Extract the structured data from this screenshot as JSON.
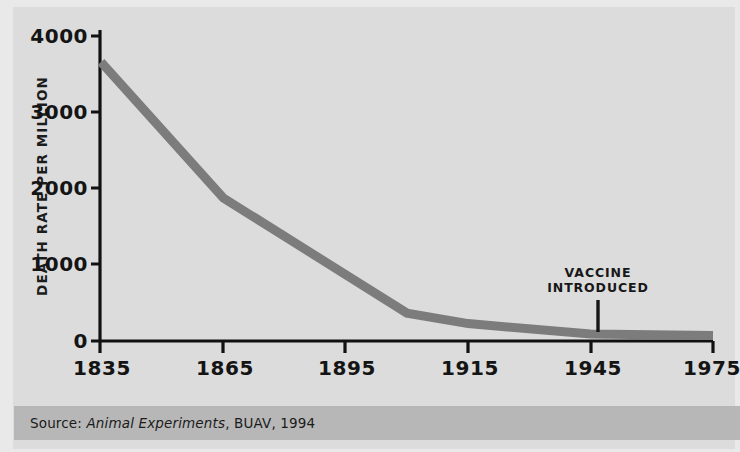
{
  "chart_data": {
    "type": "line",
    "title": "",
    "subtitle": "",
    "xlabel": "",
    "ylabel": "DEATH RATE PER MILLION",
    "x": [
      1835,
      1865,
      1905,
      1915,
      1945,
      1975
    ],
    "values": [
      4000,
      2050,
      400,
      250,
      100,
      80
    ],
    "series": [
      {
        "name": "Death rate per million",
        "x": [
          1835,
          1865,
          1905,
          1915,
          1945,
          1975
        ],
        "values": [
          4000,
          2050,
          400,
          250,
          100,
          80
        ],
        "color": "#7c7c7c"
      }
    ],
    "xtick_labels": [
      "1835",
      "1865",
      "1895",
      "1915",
      "1945",
      "1975"
    ],
    "xtick_values": [
      1835,
      1865,
      1895,
      1915,
      1945,
      1975
    ],
    "ytick_labels": [
      "4000",
      "3000",
      "2000",
      "1000",
      "0"
    ],
    "ytick_values": [
      4000,
      3000,
      2000,
      1000,
      0
    ],
    "xlim": [
      1835,
      1975
    ],
    "ylim": [
      0,
      4400
    ],
    "grid": false,
    "legend": "none",
    "annotations": [
      {
        "text_line1": "VACCINE",
        "text_line2": "INTRODUCED",
        "x": 1947,
        "pointer": true
      }
    ]
  },
  "axes": {
    "y_title": "DEATH RATE PER MILLION",
    "y_ticks": [
      {
        "label": "4000"
      },
      {
        "label": "3000"
      },
      {
        "label": "2000"
      },
      {
        "label": "1000"
      },
      {
        "label": "0"
      }
    ],
    "x_ticks": [
      {
        "label": "1835"
      },
      {
        "label": "1865"
      },
      {
        "label": "1895"
      },
      {
        "label": "1915"
      },
      {
        "label": "1945"
      },
      {
        "label": "1975"
      }
    ]
  },
  "annotation": {
    "line1": "VACCINE",
    "line2": "INTRODUCED"
  },
  "source": {
    "prefix": "Source:",
    "work_title": "Animal Experiments",
    "suffix": ", BUAV, 1994"
  },
  "colors": {
    "background": "#dcdcdc",
    "edge": "#e9e9e9",
    "axis": "#111111",
    "series": "#7c7c7c",
    "source_band": "#b7b7b7",
    "text": "#141414"
  }
}
